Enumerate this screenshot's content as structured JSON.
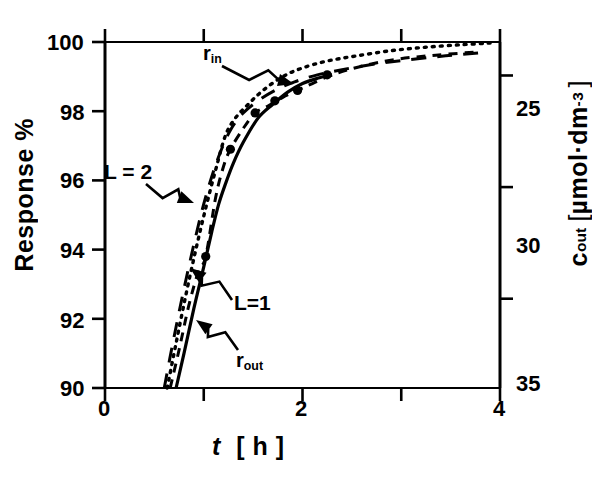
{
  "figure": {
    "background_color": "#ffffff",
    "ink_color": "#000000"
  },
  "axes": {
    "y_left": {
      "title": "Response %",
      "ticks": [
        "100",
        "98",
        "96",
        "94",
        "92",
        "90"
      ]
    },
    "y_right": {
      "title_main": "cout",
      "title_unit_open": "[",
      "title_unit": "µmol·dm",
      "title_unit_exp": "-3",
      "title_unit_close": "]",
      "ticks": [
        "25",
        "30",
        "35"
      ]
    },
    "x": {
      "title_symbol": "t",
      "title_unit": "[ h ]",
      "ticks": [
        "0",
        "2",
        "4"
      ]
    }
  },
  "annotations": {
    "r_in": {
      "base": "r",
      "sub": "in"
    },
    "r_out": {
      "base": "r",
      "sub": "out"
    },
    "l2": "L = 2",
    "l1": "L=1"
  },
  "chart_data": {
    "type": "line",
    "title": "",
    "xlabel": "t [h]",
    "ylabel": "Response %",
    "y2label": "cout [µmol·dm^-3]",
    "xlim": [
      0,
      4
    ],
    "ylim": [
      90,
      100
    ],
    "y2lim": [
      36.5,
      21.0
    ],
    "grid": false,
    "legend": "none (curves labelled by in-plot arrows)",
    "xticks": [
      0,
      1,
      2,
      3,
      4
    ],
    "xticklabels": [
      "0",
      "",
      "2",
      "",
      "4"
    ],
    "yticks": [
      90,
      92,
      94,
      96,
      98,
      100
    ],
    "yticklabels": [
      "90",
      "92",
      "94",
      "96",
      "98",
      "100"
    ],
    "y2ticks": [
      25,
      30,
      35
    ],
    "y2ticklabels": [
      "25",
      "30",
      "35"
    ],
    "series": [
      {
        "name": "r_out",
        "style": "solid",
        "label": "r_out",
        "x": [
          0.72,
          0.8,
          0.9,
          1.0,
          1.08,
          1.15,
          1.22,
          1.3,
          1.4,
          1.55,
          1.7,
          1.85,
          2.0,
          2.15,
          2.3
        ],
        "y": [
          90.0,
          91.0,
          92.3,
          93.5,
          94.5,
          95.3,
          95.9,
          96.5,
          97.1,
          97.8,
          98.2,
          98.55,
          98.8,
          98.95,
          99.05
        ]
      },
      {
        "name": "L=1",
        "style": "dashed-short",
        "label": "L = 1",
        "markers": true,
        "marker_x": [
          1.02,
          1.27,
          1.52,
          1.72,
          1.95,
          2.25
        ],
        "marker_y": [
          93.8,
          96.9,
          97.95,
          98.3,
          98.6,
          99.05
        ],
        "x": [
          0.66,
          0.75,
          0.85,
          0.95,
          1.02,
          1.12,
          1.2,
          1.27,
          1.4,
          1.52,
          1.65,
          1.8,
          1.95,
          2.1,
          2.3,
          2.6,
          2.95,
          3.35,
          3.8
        ],
        "y": [
          90.0,
          91.1,
          92.4,
          93.4,
          93.8,
          95.5,
          96.4,
          96.9,
          97.5,
          97.95,
          98.15,
          98.4,
          98.6,
          98.8,
          99.05,
          99.3,
          99.5,
          99.62,
          99.72
        ]
      },
      {
        "name": "r_in",
        "style": "dotted",
        "label": "r_in",
        "x": [
          0.63,
          0.72,
          0.82,
          0.92,
          1.02,
          1.12,
          1.22,
          1.32,
          1.45,
          1.6,
          1.8,
          2.0,
          2.25,
          2.55,
          2.9,
          3.25,
          3.6,
          3.9
        ],
        "y": [
          90.0,
          91.3,
          92.7,
          94.0,
          95.2,
          96.3,
          97.3,
          97.8,
          98.2,
          98.6,
          99.0,
          99.25,
          99.45,
          99.6,
          99.75,
          99.85,
          99.92,
          99.97
        ]
      },
      {
        "name": "L=2",
        "style": "dashed-long",
        "label": "L = 2",
        "x": [
          0.6,
          0.68,
          0.78,
          0.88,
          0.98,
          1.08,
          1.18,
          1.28,
          1.4,
          1.55,
          1.72,
          1.92,
          2.15,
          2.4,
          2.7,
          3.05,
          3.45,
          3.85
        ],
        "y": [
          90.0,
          91.2,
          92.6,
          93.9,
          95.1,
          96.1,
          96.9,
          97.5,
          97.95,
          98.3,
          98.6,
          98.85,
          99.05,
          99.2,
          99.35,
          99.48,
          99.6,
          99.7
        ]
      }
    ]
  }
}
